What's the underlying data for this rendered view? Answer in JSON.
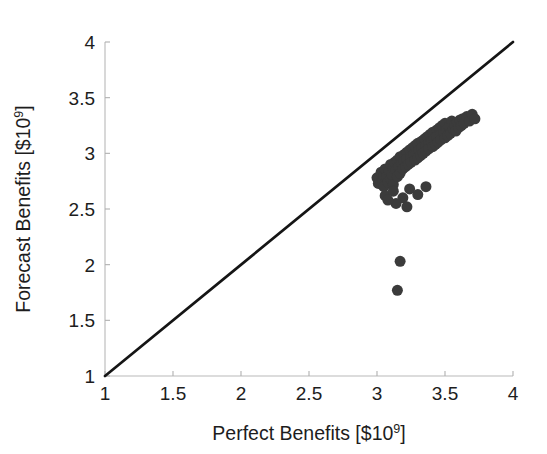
{
  "chart_data": {
    "type": "scatter",
    "title": "",
    "xlabel": "Perfect Benefits [$10^9]",
    "ylabel": "Forecast Benefits [$10^9]",
    "xlabel_main": "Perfect Benefits [$10",
    "xlabel_exp": "9",
    "xlabel_tail": "]",
    "ylabel_main": "Forecast Benefits [$10",
    "ylabel_exp": "9",
    "ylabel_tail": "]",
    "xlim": [
      1,
      4
    ],
    "ylim": [
      1,
      4
    ],
    "xticks": [
      1,
      1.5,
      2,
      2.5,
      3,
      3.5,
      4
    ],
    "yticks": [
      1,
      1.5,
      2,
      2.5,
      3,
      3.5,
      4
    ],
    "xtick_labels": [
      "1",
      "1.5",
      "2",
      "2.5",
      "3",
      "3.5",
      "4"
    ],
    "ytick_labels": [
      "1",
      "1.5",
      "2",
      "2.5",
      "3",
      "3.5",
      "4"
    ],
    "grid": false,
    "legend": "none",
    "marker_color": "#3b3b3b",
    "marker_size_px": 11,
    "reference_line": {
      "label": "1:1 line",
      "color": "#151515",
      "from": [
        1,
        1
      ],
      "to": [
        4,
        4
      ]
    },
    "annotations": [
      "All forecast benefits lie below the 1:1 line",
      "Two low outliers near x = 3.15 with y near 1.8 and 2.0"
    ],
    "series": [
      {
        "name": "Forecast vs Perfect Benefits",
        "points": [
          [
            3.0,
            2.78
          ],
          [
            3.01,
            2.73
          ],
          [
            3.03,
            2.83
          ],
          [
            3.04,
            2.76
          ],
          [
            3.05,
            2.8
          ],
          [
            3.05,
            2.7
          ],
          [
            3.06,
            2.86
          ],
          [
            3.07,
            2.79
          ],
          [
            3.08,
            2.74
          ],
          [
            3.09,
            2.84
          ],
          [
            3.1,
            2.9
          ],
          [
            3.1,
            2.77
          ],
          [
            3.11,
            2.81
          ],
          [
            3.12,
            2.87
          ],
          [
            3.12,
            2.72
          ],
          [
            3.13,
            2.92
          ],
          [
            3.14,
            2.85
          ],
          [
            3.15,
            2.79
          ],
          [
            3.15,
            2.94
          ],
          [
            3.16,
            2.88
          ],
          [
            3.17,
            2.82
          ],
          [
            3.17,
            2.97
          ],
          [
            3.18,
            2.91
          ],
          [
            3.19,
            2.86
          ],
          [
            3.2,
            2.99
          ],
          [
            3.2,
            2.93
          ],
          [
            3.21,
            2.88
          ],
          [
            3.22,
            3.01
          ],
          [
            3.22,
            2.95
          ],
          [
            3.23,
            2.9
          ],
          [
            3.24,
            3.03
          ],
          [
            3.25,
            2.97
          ],
          [
            3.25,
            2.92
          ],
          [
            3.26,
            3.05
          ],
          [
            3.27,
            2.99
          ],
          [
            3.28,
            2.94
          ],
          [
            3.28,
            3.07
          ],
          [
            3.29,
            3.01
          ],
          [
            3.3,
            2.96
          ],
          [
            3.3,
            3.09
          ],
          [
            3.31,
            3.03
          ],
          [
            3.32,
            2.98
          ],
          [
            3.33,
            3.11
          ],
          [
            3.33,
            3.05
          ],
          [
            3.34,
            3.0
          ],
          [
            3.35,
            3.13
          ],
          [
            3.36,
            3.07
          ],
          [
            3.36,
            3.02
          ],
          [
            3.37,
            3.15
          ],
          [
            3.38,
            3.09
          ],
          [
            3.38,
            3.04
          ],
          [
            3.39,
            3.17
          ],
          [
            3.4,
            3.11
          ],
          [
            3.41,
            3.06
          ],
          [
            3.41,
            3.19
          ],
          [
            3.42,
            3.13
          ],
          [
            3.43,
            3.08
          ],
          [
            3.44,
            3.21
          ],
          [
            3.44,
            3.15
          ],
          [
            3.45,
            3.1
          ],
          [
            3.46,
            3.23
          ],
          [
            3.47,
            3.17
          ],
          [
            3.47,
            3.12
          ],
          [
            3.48,
            3.25
          ],
          [
            3.49,
            3.19
          ],
          [
            3.5,
            3.14
          ],
          [
            3.5,
            3.27
          ],
          [
            3.51,
            3.21
          ],
          [
            3.52,
            3.16
          ],
          [
            3.53,
            3.24
          ],
          [
            3.54,
            3.18
          ],
          [
            3.55,
            3.29
          ],
          [
            3.56,
            3.22
          ],
          [
            3.57,
            3.26
          ],
          [
            3.58,
            3.2
          ],
          [
            3.59,
            3.28
          ],
          [
            3.6,
            3.23
          ],
          [
            3.61,
            3.3
          ],
          [
            3.62,
            3.25
          ],
          [
            3.63,
            3.31
          ],
          [
            3.64,
            3.27
          ],
          [
            3.66,
            3.33
          ],
          [
            3.68,
            3.29
          ],
          [
            3.7,
            3.35
          ],
          [
            3.72,
            3.31
          ],
          [
            3.06,
            2.62
          ],
          [
            3.12,
            2.66
          ],
          [
            3.19,
            2.6
          ],
          [
            3.24,
            2.68
          ],
          [
            3.3,
            2.63
          ],
          [
            3.36,
            2.7
          ],
          [
            3.14,
            2.55
          ],
          [
            3.22,
            2.52
          ],
          [
            3.08,
            2.58
          ],
          [
            3.17,
            2.03
          ],
          [
            3.15,
            1.77
          ]
        ]
      }
    ]
  }
}
